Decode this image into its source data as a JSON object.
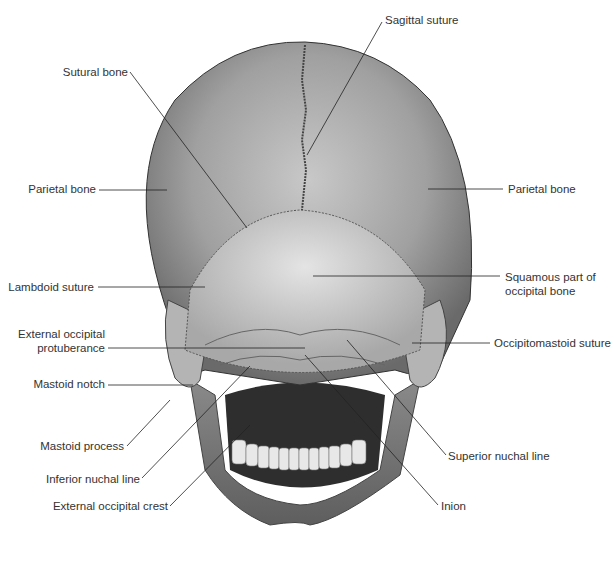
{
  "figure": {
    "labels_left": [
      {
        "id": "sutural-bone",
        "text": "Sutural bone"
      },
      {
        "id": "parietal-bone-left",
        "text": "Parietal bone"
      },
      {
        "id": "lambdoid-suture",
        "text": "Lambdoid suture"
      },
      {
        "id": "external-occipital-protuberance-1",
        "text": "External occipital"
      },
      {
        "id": "external-occipital-protuberance-2",
        "text": "protuberance"
      },
      {
        "id": "mastoid-notch",
        "text": "Mastoid notch"
      },
      {
        "id": "mastoid-process",
        "text": "Mastoid process"
      },
      {
        "id": "inferior-nuchal-line",
        "text": "Inferior nuchal line"
      },
      {
        "id": "external-occipital-crest",
        "text": "External occipital crest"
      }
    ],
    "labels_right": [
      {
        "id": "sagittal-suture",
        "text": "Sagittal suture"
      },
      {
        "id": "parietal-bone-right",
        "text": "Parietal bone"
      },
      {
        "id": "squamous-part-1",
        "text": "Squamous part of"
      },
      {
        "id": "squamous-part-2",
        "text": "occipital bone"
      },
      {
        "id": "occipitomastoid-suture",
        "text": "Occipitomastoid suture"
      },
      {
        "id": "superior-nuchal-line",
        "text": "Superior nuchal line"
      },
      {
        "id": "inion",
        "text": "Inion"
      }
    ],
    "colors": {
      "bone_dark": "#6e6e6e",
      "bone_mid": "#9a9a9a",
      "bone_light": "#d6d6d6",
      "leader": "#222222",
      "text": "#333333"
    }
  }
}
